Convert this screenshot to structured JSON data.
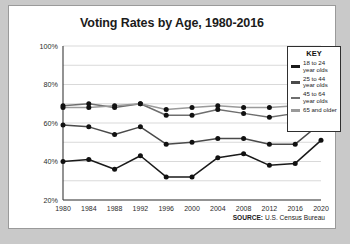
{
  "chart_data": {
    "type": "line",
    "title": "Voting Rates by Age, 1980-2016",
    "xlabel": "",
    "ylabel": "",
    "ylim": [
      20,
      100
    ],
    "yticks": [
      "20%",
      "40%",
      "60%",
      "80%",
      "100%"
    ],
    "ytick_values": [
      20,
      40,
      60,
      80,
      100
    ],
    "grid": true,
    "legend_position": "right",
    "legend_title": "KEY",
    "categories": [
      1980,
      1984,
      1988,
      1992,
      1996,
      2000,
      2004,
      2008,
      2012,
      2016,
      2020
    ],
    "xtick_labels": [
      "1980",
      "1984",
      "1988",
      "1992",
      "1996",
      "2000",
      "2004",
      "2008",
      "2012",
      "2016",
      "2020"
    ],
    "series": [
      {
        "name": "18 to 24 year olds",
        "color": "#1a1a1a",
        "values": [
          40,
          41,
          36,
          43,
          32,
          32,
          42,
          44,
          38,
          39,
          51
        ]
      },
      {
        "name": "25 to 44 year olds",
        "color": "#4a4a4a",
        "values": [
          59,
          58,
          54,
          58,
          49,
          50,
          52,
          52,
          49,
          49,
          60
        ]
      },
      {
        "name": "45 to 64 year olds",
        "color": "#6e6e6e",
        "values": [
          69,
          70,
          68,
          70,
          64,
          64,
          67,
          65,
          63,
          65,
          71
        ]
      },
      {
        "name": "65 and older",
        "color": "#9a9a9a",
        "values": [
          68,
          68,
          69,
          70,
          67,
          68,
          69,
          68,
          68,
          69,
          72
        ]
      }
    ],
    "source": {
      "label": "SOURCE:",
      "text": "U.S. Census Bureau"
    }
  }
}
